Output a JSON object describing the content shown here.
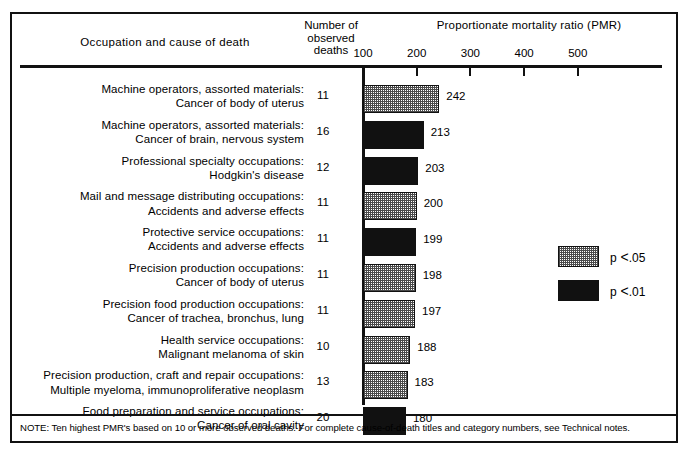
{
  "header": {
    "occupation_column": "Occupation and cause of death",
    "deaths_column_line1": "Number of",
    "deaths_column_line2": "observed",
    "deaths_column_line3": "deaths",
    "axis_title": "Proportionate mortality ratio (PMR)"
  },
  "legend": {
    "items": [
      {
        "label_p": "p",
        "label_lt": "<",
        "label_val": ".05",
        "fill": "stipple",
        "full": "p < .05"
      },
      {
        "label_p": "p",
        "label_lt": "<",
        "label_val": ".01",
        "fill": "solid",
        "full": "p < .01"
      }
    ]
  },
  "note": "NOTE: Ten highest PMR's based on 10 or more observed deaths. For complete cause-of-death titles and category numbers, see Technical notes.",
  "chart_data": {
    "type": "bar",
    "orientation": "horizontal",
    "title": "Proportionate mortality ratio (PMR)",
    "xlabel": "Proportionate mortality ratio (PMR)",
    "ylabel": "Occupation and cause of death",
    "xlim": [
      100,
      600
    ],
    "xticks": [
      100,
      200,
      300,
      400,
      500
    ],
    "xtick_labels": [
      "100",
      "200",
      "300",
      "400",
      "500"
    ],
    "grid": false,
    "legend_position": "middle-right",
    "baseline": 100,
    "categories": [
      "Machine operators, assorted materials: Cancer of body of uterus",
      "Machine operators, assorted materials: Cancer of brain, nervous system",
      "Professional specialty occupations: Hodgkin's disease",
      "Mail and message distributing occupations: Accidents and adverse effects",
      "Protective service occupations: Accidents and adverse effects",
      "Precision production occupations: Cancer of body of uterus",
      "Precision food production occupations: Cancer of trachea, bronchus, lung",
      "Health service occupations: Malignant melanoma of skin",
      "Precision production, craft and repair occupations: Multiple myeloma, immunoproliferative neoplasm",
      "Food preparation and service occupations: Cancer of oral cavity"
    ],
    "values": [
      242,
      213,
      203,
      200,
      199,
      198,
      197,
      188,
      183,
      180
    ],
    "observed_deaths": [
      11,
      16,
      12,
      11,
      11,
      11,
      11,
      10,
      13,
      20
    ],
    "significance": [
      "p<.05",
      "p<.01",
      "p<.01",
      "p<.05",
      "p<.01",
      "p<.05",
      "p<.05",
      "p<.05",
      "p<.05",
      "p<.01"
    ],
    "rows": [
      {
        "occupation": "Machine operators, assorted materials:",
        "cause": "Cancer of body of uterus",
        "deaths": "11",
        "value": 242,
        "value_label": "242",
        "fill": "stipple"
      },
      {
        "occupation": "Machine operators, assorted materials:",
        "cause": "Cancer of brain, nervous system",
        "deaths": "16",
        "value": 213,
        "value_label": "213",
        "fill": "solid"
      },
      {
        "occupation": "Professional specialty occupations:",
        "cause": "Hodgkin's disease",
        "deaths": "12",
        "value": 203,
        "value_label": "203",
        "fill": "solid"
      },
      {
        "occupation": "Mail and message distributing occupations:",
        "cause": "Accidents and adverse effects",
        "deaths": "11",
        "value": 200,
        "value_label": "200",
        "fill": "stipple"
      },
      {
        "occupation": "Protective service occupations:",
        "cause": "Accidents and adverse effects",
        "deaths": "11",
        "value": 199,
        "value_label": "199",
        "fill": "solid"
      },
      {
        "occupation": "Precision production occupations:",
        "cause": "Cancer of body of uterus",
        "deaths": "11",
        "value": 198,
        "value_label": "198",
        "fill": "stipple"
      },
      {
        "occupation": "Precision food production occupations:",
        "cause": "Cancer of trachea, bronchus, lung",
        "deaths": "11",
        "value": 197,
        "value_label": "197",
        "fill": "stipple"
      },
      {
        "occupation": "Health service occupations:",
        "cause": "Malignant melanoma of skin",
        "deaths": "10",
        "value": 188,
        "value_label": "188",
        "fill": "stipple"
      },
      {
        "occupation": "Precision production, craft and repair occupations:",
        "cause": "Multiple myeloma, immunoproliferative neoplasm",
        "deaths": "13",
        "value": 183,
        "value_label": "183",
        "fill": "stipple"
      },
      {
        "occupation": "Food preparation and service occupations:",
        "cause": "Cancer of oral cavity",
        "deaths": "20",
        "value": 180,
        "value_label": "180",
        "fill": "solid"
      }
    ]
  }
}
